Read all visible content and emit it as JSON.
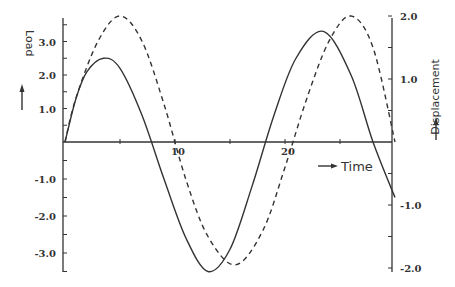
{
  "chart_data": {
    "type": "line",
    "title": "",
    "xlabel": "Time",
    "ylabel": "Load",
    "ylabel_right": "Displacement",
    "xlim": [
      0,
      30
    ],
    "ylim": [
      -3.5,
      3.5
    ],
    "ylim_right": [
      -2.0,
      2.0
    ],
    "x_ticks": [
      {
        "value": 5,
        "label": ""
      },
      {
        "value": 10,
        "label": "10"
      },
      {
        "value": 15,
        "label": ""
      },
      {
        "value": 20,
        "label": "20"
      },
      {
        "value": 25,
        "label": ""
      }
    ],
    "y_ticks_left": [
      {
        "value": 3.0,
        "label": "3.0"
      },
      {
        "value": 2.0,
        "label": "2.0"
      },
      {
        "value": 1.0,
        "label": "1.0"
      },
      {
        "value": -1.0,
        "label": "-1.0"
      },
      {
        "value": -2.0,
        "label": "-2.0"
      },
      {
        "value": -3.0,
        "label": "-3.0"
      }
    ],
    "y_ticks_right": [
      {
        "value": 2.0,
        "label": "2.0"
      },
      {
        "value": 1.0,
        "label": "1.0"
      },
      {
        "value": -1.0,
        "label": "-1.0"
      },
      {
        "value": -2.0,
        "label": "-2.0"
      }
    ],
    "grid": false,
    "legend": null,
    "series": [
      {
        "name": "Load",
        "axis": "left",
        "style": "solid",
        "x": [
          0,
          1,
          2,
          3.5,
          5,
          7,
          9,
          11,
          13,
          15,
          17,
          19,
          21,
          23.5,
          26,
          28,
          30
        ],
        "values": [
          0,
          1.3,
          2.1,
          2.5,
          2.2,
          0.8,
          -1.0,
          -2.6,
          -3.5,
          -2.9,
          -1.2,
          0.8,
          2.5,
          3.3,
          2.0,
          0,
          -1.5
        ]
      },
      {
        "name": "Displacement",
        "axis": "right",
        "style": "dashed",
        "x": [
          0,
          1,
          3,
          5,
          7,
          9,
          11,
          13,
          15.5,
          18,
          20,
          22,
          24,
          26,
          28,
          30
        ],
        "values": [
          0,
          0.7,
          1.6,
          2.0,
          1.6,
          0.6,
          -0.6,
          -1.5,
          -1.95,
          -1.4,
          -0.4,
          0.7,
          1.6,
          2.0,
          1.5,
          0
        ]
      }
    ],
    "annotations": [
      {
        "text": "Time",
        "arrow": "right"
      },
      {
        "text": "Load",
        "arrow": "up"
      },
      {
        "text": "Displacement",
        "arrow": "up"
      }
    ]
  }
}
